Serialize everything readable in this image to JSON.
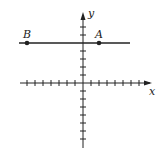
{
  "diagram": {
    "type": "coordinate-plane",
    "axes": {
      "x_label": "x",
      "y_label": "y",
      "x_ticks_range": [
        -7,
        7
      ],
      "y_ticks_range": [
        -8,
        4
      ],
      "unit_px": 8
    },
    "line": {
      "description": "horizontal line",
      "y": 5,
      "x_range": [
        -8,
        6.5
      ]
    },
    "points": [
      {
        "label": "A",
        "x": 2,
        "y": 5
      },
      {
        "label": "B",
        "x": -7,
        "y": 5
      }
    ],
    "colors": {
      "ink": "#222222",
      "background": "#ffffff"
    }
  }
}
